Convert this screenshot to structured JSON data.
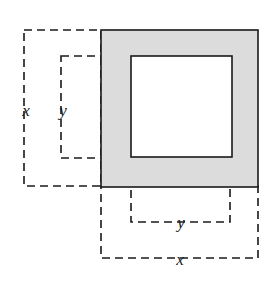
{
  "figure": {
    "background_color": "#ffffff",
    "shaded_fill_color": "#dcdcdc",
    "solid_stroke_color": "#1a1a1a",
    "dashed_stroke_color": "#1a1a1a",
    "stroke_width": 1.6,
    "dash_pattern": "8 5"
  },
  "shapes": {
    "outer_square": {
      "name": "shaded-outer-square",
      "x": 101,
      "y": 30,
      "side": 157,
      "fill": "#dcdcdc",
      "stroke": "#1a1a1a"
    },
    "inner_square": {
      "name": "white-inner-square",
      "x": 131,
      "y": 56,
      "side": 101,
      "fill": "#ffffff",
      "stroke": "#1a1a1a"
    }
  },
  "guides": {
    "left_x_rect": {
      "x": 24,
      "y": 30,
      "width": 77,
      "height": 156
    },
    "left_y_rect": {
      "x": 61,
      "y": 56,
      "width": 70,
      "height": 102
    },
    "bottom_y_rect": {
      "x": 131,
      "y": 158,
      "width": 99,
      "height": 64
    },
    "bottom_x_rect": {
      "x": 101,
      "y": 186,
      "width": 157,
      "height": 72
    }
  },
  "labels": {
    "left_x": {
      "text": "x",
      "x": 26,
      "y": 110
    },
    "left_y": {
      "text": "y",
      "x": 63,
      "y": 110
    },
    "bottom_y": {
      "text": "y",
      "x": 181,
      "y": 222
    },
    "bottom_x": {
      "text": "x",
      "x": 180,
      "y": 259
    }
  }
}
